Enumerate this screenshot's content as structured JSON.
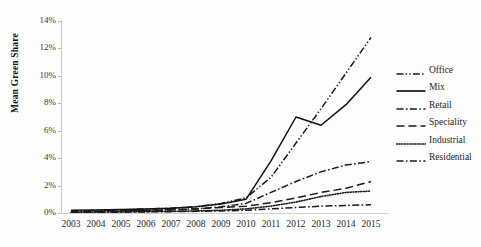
{
  "chart_data": {
    "type": "line",
    "title": "",
    "xlabel": "",
    "ylabel": "Mean Green Share",
    "categories": [
      "2003",
      "2004",
      "2005",
      "2006",
      "2007",
      "2008",
      "2009",
      "2010",
      "2011",
      "2012",
      "2013",
      "2014",
      "2015"
    ],
    "x": [
      2003,
      2004,
      2005,
      2006,
      2007,
      2008,
      2009,
      2010,
      2011,
      2012,
      2013,
      2014,
      2015
    ],
    "ylim": [
      0,
      14
    ],
    "xlim": [
      2003,
      2015
    ],
    "yticks": [
      0,
      2,
      4,
      6,
      8,
      10,
      12,
      14
    ],
    "ytick_labels": [
      "0%",
      "2%",
      "4%",
      "6%",
      "8%",
      "10%",
      "12%",
      "14%"
    ],
    "y_unit": "%",
    "grid": false,
    "legend_position": "right",
    "series": [
      {
        "name": "Office",
        "style": "dash-dot-dot",
        "color": "#1a1a1a",
        "values": [
          0.15,
          0.18,
          0.22,
          0.3,
          0.35,
          0.45,
          0.7,
          1.1,
          2.6,
          5.1,
          7.6,
          10.2,
          12.8
        ]
      },
      {
        "name": "Mix",
        "style": "solid",
        "color": "#111111",
        "values": [
          0.2,
          0.22,
          0.25,
          0.3,
          0.35,
          0.45,
          0.65,
          1.0,
          3.8,
          7.0,
          6.4,
          7.9,
          9.9
        ]
      },
      {
        "name": "Retail",
        "style": "dash-dot",
        "color": "#1a1a1a",
        "values": [
          0.1,
          0.12,
          0.15,
          0.2,
          0.25,
          0.3,
          0.45,
          0.7,
          1.5,
          2.3,
          3.0,
          3.5,
          3.75
        ]
      },
      {
        "name": "Speciality",
        "style": "long-dash",
        "color": "#1a1a1a",
        "values": [
          0.1,
          0.12,
          0.15,
          0.18,
          0.22,
          0.3,
          0.4,
          0.5,
          0.75,
          1.1,
          1.5,
          1.8,
          2.3
        ]
      },
      {
        "name": "Industrial",
        "style": "dotted",
        "color": "#1a1a1a",
        "values": [
          0.05,
          0.06,
          0.08,
          0.1,
          0.12,
          0.15,
          0.2,
          0.3,
          0.5,
          0.8,
          1.2,
          1.5,
          1.6
        ]
      },
      {
        "name": "Residential",
        "style": "dash-dot",
        "color": "#1a1a1a",
        "values": [
          0.05,
          0.05,
          0.06,
          0.08,
          0.1,
          0.12,
          0.15,
          0.2,
          0.3,
          0.4,
          0.5,
          0.55,
          0.6
        ]
      }
    ]
  },
  "legend": {
    "entries": [
      {
        "label": "Office"
      },
      {
        "label": "Mix"
      },
      {
        "label": "Retail"
      },
      {
        "label": "Speciality"
      },
      {
        "label": "Industrial"
      },
      {
        "label": "Residential"
      }
    ]
  }
}
